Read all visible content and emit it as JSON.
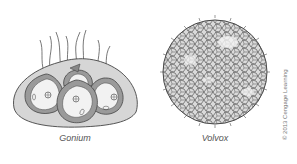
{
  "figure": {
    "panels": [
      {
        "id": "gonium",
        "label": "Gonium"
      },
      {
        "id": "volvox",
        "label": "Volvox"
      }
    ],
    "credit": "© 2013 Cengage Learning"
  },
  "colors": {
    "outline": "#444444",
    "matrix_fill": "#d4d4d4",
    "cell_wall": "#9a9a9a",
    "cell_interior": "#f0f0f0",
    "volvox_fill": "#dadada"
  }
}
